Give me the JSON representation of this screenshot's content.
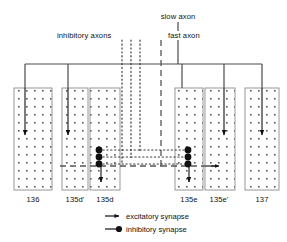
{
  "figure": {
    "type": "neural-wiring-diagram",
    "width": 287,
    "height": 242,
    "background": "#ffffff",
    "line_color": "#444444",
    "ink_color": "#111111"
  },
  "axon_labels": {
    "slow": "slow axon",
    "inhibitory": "inhibitory axons",
    "fast": "fast axon"
  },
  "muscles": [
    {
      "id": "m136",
      "label": "136",
      "x": 14,
      "y": 88,
      "w": 38,
      "h": 102
    },
    {
      "id": "m135dp",
      "label": "135d'",
      "x": 62,
      "y": 88,
      "w": 26,
      "h": 102
    },
    {
      "id": "m135d",
      "label": "135d",
      "x": 90,
      "y": 88,
      "w": 30,
      "h": 102
    },
    {
      "id": "m135e",
      "label": "135e",
      "x": 175,
      "y": 88,
      "w": 28,
      "h": 102
    },
    {
      "id": "m135ep",
      "label": "135e'",
      "x": 205,
      "y": 88,
      "w": 30,
      "h": 102
    },
    {
      "id": "m137",
      "label": "137",
      "x": 245,
      "y": 88,
      "w": 34,
      "h": 102
    }
  ],
  "legend": {
    "items": [
      {
        "symbol": "arrow",
        "label": "excitatory synapse"
      },
      {
        "symbol": "circle",
        "label": "inhibitory synapse"
      }
    ]
  },
  "bus": {
    "y": 64,
    "x_start": 25,
    "x_end": 262,
    "drops_x": [
      25,
      68,
      182,
      224,
      262
    ]
  },
  "inhibitory_axon_x": [
    122,
    131,
    140
  ],
  "fast_axon_x": 161,
  "slow_axon_x": 178,
  "synapse_rows_y": [
    150,
    157,
    164
  ],
  "colors": {
    "stipple": "#5a5a5a",
    "rect_border": "#8c8c8c",
    "wire": "#4a4a4a",
    "dash": "#555555"
  }
}
